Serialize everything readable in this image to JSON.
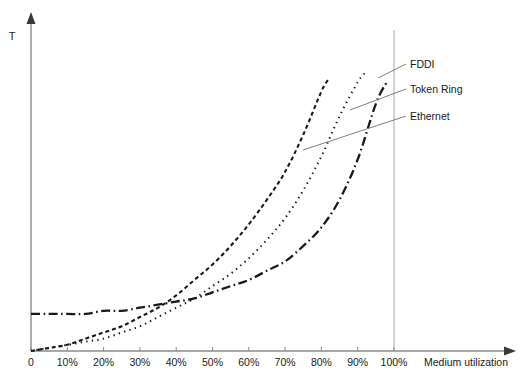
{
  "chart_data": {
    "type": "line",
    "title": "",
    "xlabel": "Medium utilization",
    "ylabel": "T",
    "xlim": [
      0,
      110
    ],
    "ylim": [
      0,
      100
    ],
    "grid": false,
    "legend_position": "right-inline-labels",
    "x_tick_labels": [
      "0",
      "10%",
      "20%",
      "30%",
      "40%",
      "50%",
      "60%",
      "70%",
      "80%",
      "90%",
      "100%"
    ],
    "x_tick_values": [
      0,
      10,
      20,
      30,
      40,
      50,
      60,
      70,
      80,
      90,
      100
    ],
    "y_tick_labels": [],
    "reference_line_x": 100,
    "series": [
      {
        "name": "FDDI",
        "dash_style": "dashed",
        "color": "#1a1a1a",
        "x": [
          0,
          5,
          10,
          15,
          20,
          25,
          30,
          35,
          40,
          45,
          50,
          55,
          60,
          65,
          70,
          75,
          80,
          82
        ],
        "y": [
          0,
          1,
          2,
          4,
          6,
          8,
          11,
          14,
          18,
          23,
          28,
          34,
          41,
          49,
          58,
          70,
          84,
          88
        ]
      },
      {
        "name": "Token Ring",
        "dash_style": "dotted",
        "color": "#1a1a1a",
        "x": [
          0,
          5,
          10,
          15,
          20,
          25,
          30,
          35,
          40,
          45,
          50,
          55,
          60,
          65,
          70,
          75,
          80,
          85,
          90,
          92
        ],
        "y": [
          0,
          1,
          2,
          3,
          4,
          6,
          8,
          11,
          14,
          17,
          21,
          25,
          30,
          36,
          43,
          52,
          63,
          76,
          87,
          90
        ]
      },
      {
        "name": "Ethernet",
        "dash_style": "dash-dot",
        "color": "#1a1a1a",
        "x": [
          0,
          5,
          10,
          15,
          20,
          25,
          30,
          35,
          40,
          45,
          50,
          55,
          60,
          65,
          70,
          75,
          80,
          85,
          90,
          95,
          98
        ],
        "y": [
          12,
          12,
          12,
          12,
          13,
          13,
          14,
          15,
          16,
          17,
          19,
          21,
          23,
          26,
          29,
          34,
          40,
          49,
          62,
          80,
          87
        ]
      }
    ],
    "annotations": [
      {
        "label": "FDDI",
        "label_x": 410,
        "label_y": 68,
        "leader_from_x": 378,
        "leader_from_y": 78
      },
      {
        "label": "Token Ring",
        "label_x": 410,
        "label_y": 93,
        "leader_from_x": 350,
        "leader_from_y": 110
      },
      {
        "label": "Ethernet",
        "label_x": 410,
        "label_y": 120,
        "leader_from_x": 303,
        "leader_from_y": 150
      }
    ]
  },
  "axes": {
    "x_axis_title": "Medium utilization",
    "y_axis_title": "T",
    "ticks": [
      {
        "label": "0"
      },
      {
        "label": "10%"
      },
      {
        "label": "20%"
      },
      {
        "label": "30%"
      },
      {
        "label": "40%"
      },
      {
        "label": "50%"
      },
      {
        "label": "60%"
      },
      {
        "label": "70%"
      },
      {
        "label": "80%"
      },
      {
        "label": "90%"
      },
      {
        "label": "100%"
      }
    ]
  },
  "series_labels": {
    "fddi": "FDDI",
    "token_ring": "Token Ring",
    "ethernet": "Ethernet"
  },
  "colors": {
    "curve": "#1a1a1a",
    "axis": "#808080",
    "leader": "#808080",
    "reference_line": "#a0a0a0",
    "background": "#ffffff"
  }
}
